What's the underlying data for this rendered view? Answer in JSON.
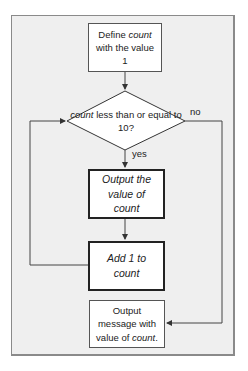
{
  "diagram": {
    "type": "flowchart",
    "nodes": {
      "start": {
        "shape": "process",
        "text_prefix": "Define ",
        "text_var": "count",
        "text_suffix": " with the value 1"
      },
      "decision": {
        "shape": "decision",
        "text_var": "count",
        "text_suffix": " less than or equal to 10?"
      },
      "output_value": {
        "shape": "process",
        "text": "Output the value of count"
      },
      "increment": {
        "shape": "process",
        "text": "Add 1 to count"
      },
      "end": {
        "shape": "process",
        "text_prefix": "Output message with value of ",
        "text_var": "count",
        "text_suffix": "."
      }
    },
    "edge_labels": {
      "yes": "yes",
      "no": "no"
    },
    "edges": [
      {
        "from": "start",
        "to": "decision"
      },
      {
        "from": "decision",
        "to": "output_value",
        "label": "yes"
      },
      {
        "from": "output_value",
        "to": "increment"
      },
      {
        "from": "increment",
        "to": "decision"
      },
      {
        "from": "decision",
        "to": "end",
        "label": "no"
      }
    ]
  }
}
